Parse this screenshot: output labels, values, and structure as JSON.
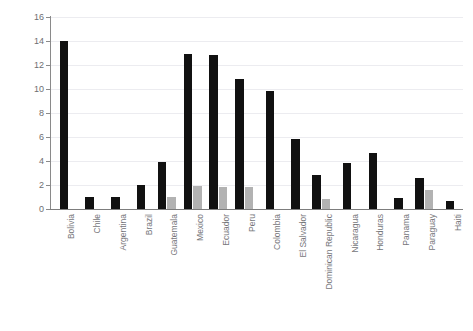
{
  "chart_data": {
    "type": "bar",
    "title": "",
    "xlabel": "",
    "ylabel": "",
    "ylim": [
      0,
      16
    ],
    "ytick_step": 2,
    "yticks": [
      0,
      2,
      4,
      6,
      8,
      10,
      12,
      14,
      16
    ],
    "ytick_labels": [
      "0",
      "2",
      "4",
      "6",
      "8",
      "10",
      "12",
      "14",
      "16"
    ],
    "grid": true,
    "grid_axis": "y",
    "legend": false,
    "legend_position": "none",
    "orientation": "vertical",
    "categories": [
      "Bolivia",
      "Chile",
      "Argentina",
      "Brazil",
      "Guatemala",
      "Mexico",
      "Ecuador",
      "Peru",
      "Colombia",
      "El Salvador",
      "Dominican Republic",
      "Nicaragua",
      "Honduras",
      "Panama",
      "Paraguay",
      "Haiti"
    ],
    "series": [
      {
        "name": "series-1",
        "color": "#111111",
        "values": [
          14.0,
          1.0,
          1.0,
          2.0,
          3.9,
          12.9,
          12.85,
          10.8,
          9.8,
          5.8,
          2.8,
          3.8,
          4.7,
          0.9,
          2.6,
          0.7
        ]
      },
      {
        "name": "series-2",
        "color": "#b2b2b2",
        "values": [
          null,
          null,
          null,
          null,
          1.0,
          1.9,
          1.85,
          1.85,
          null,
          null,
          0.8,
          null,
          null,
          null,
          1.6,
          null
        ]
      }
    ]
  },
  "colors": {
    "series_1": "#111111",
    "series_2": "#b2b2b2",
    "gridline": "#ececf0",
    "axis": "#7d7d7d",
    "tick_text": "#6e6e72",
    "category_text": "#76767a",
    "background": "#ffffff"
  }
}
